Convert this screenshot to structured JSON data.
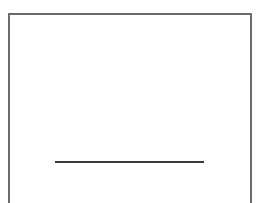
{
  "diagram": {
    "frame": {
      "shape": "rectangle",
      "border_color": "#6b6b6b"
    },
    "line": {
      "shape": "horizontal-line",
      "color": "#3a3a3a"
    }
  }
}
